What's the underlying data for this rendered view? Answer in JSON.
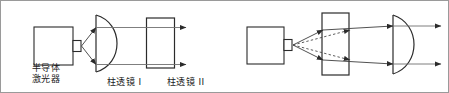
{
  "figure": {
    "type": "optical-ray-diagram",
    "panels": 2,
    "stroke_color": "#1a1a1a",
    "ray_color": "#5a5a5a",
    "border_color": "#9a9a9a",
    "background": "#ffffff"
  },
  "left_panel": {
    "labels": {
      "source_line1": "半导体",
      "source_line2": "激光器",
      "lens1": "柱透镜 I",
      "lens2": "柱透镜 II"
    },
    "components": [
      {
        "name": "semiconductor-laser",
        "shape": "rectangle-with-emitter-nub"
      },
      {
        "name": "cylindrical-lens-1",
        "shape": "plano-convex"
      },
      {
        "name": "cylindrical-lens-2",
        "shape": "rectangle"
      }
    ],
    "rays": {
      "diverging_count": 2,
      "collimated_count": 2,
      "dashed_count": 0
    }
  },
  "right_panel": {
    "labels": {},
    "components": [
      {
        "name": "semiconductor-laser",
        "shape": "rectangle-with-emitter-nub"
      },
      {
        "name": "cylindrical-lens-rect",
        "shape": "rectangle"
      },
      {
        "name": "cylindrical-lens-convex",
        "shape": "plano-convex"
      }
    ],
    "rays": {
      "diverging_count": 2,
      "converging_count": 2,
      "collimated_count": 2,
      "dashed_count": 2
    }
  }
}
